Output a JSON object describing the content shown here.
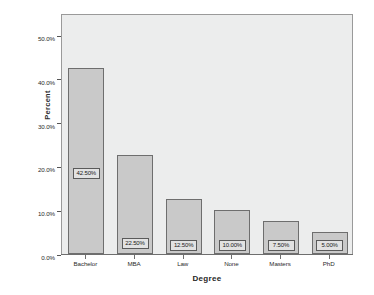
{
  "chart_data": {
    "type": "bar",
    "title": "",
    "subtitle": "",
    "xlabel": "Degree",
    "ylabel": "Percent",
    "categories": [
      "Bachelor",
      "MBA",
      "Law",
      "None",
      "Masters",
      "PhD"
    ],
    "values": [
      42.5,
      22.5,
      12.5,
      10.0,
      7.5,
      5.0
    ],
    "data_labels": [
      "42.50%",
      "22.50%",
      "12.50%",
      "10.00%",
      "7.50%",
      "5.00%"
    ],
    "ylim": [
      0,
      55
    ],
    "ytick_values": [
      0.0,
      10.0,
      20.0,
      30.0,
      40.0,
      50.0
    ],
    "ytick_labels": [
      "0.0%",
      "10.0%",
      "20.0%",
      "30.0%",
      "40.0%",
      "50.0%"
    ],
    "grid": false,
    "legend": "none",
    "bar_fill_color": "#c9c9c9",
    "bar_border_color": "#6e6e6e",
    "plot_background_color": "#eceded",
    "figure_background_color": "#ffffff"
  }
}
